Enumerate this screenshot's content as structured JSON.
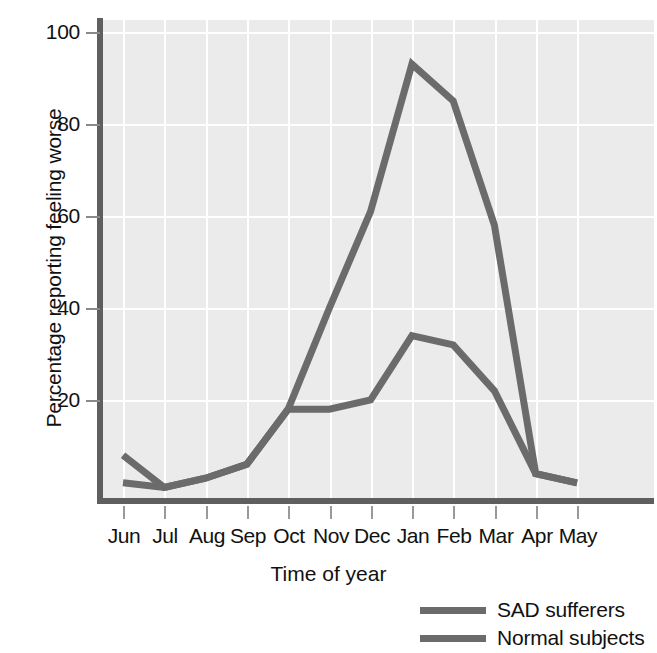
{
  "chart_data": {
    "type": "line",
    "title": "",
    "xlabel": "Time of year",
    "ylabel": "Percentage reporting feeling worse",
    "categories": [
      "Jun",
      "Jul",
      "Aug",
      "Sep",
      "Oct",
      "Nov",
      "Dec",
      "Jan",
      "Feb",
      "Mar",
      "Apr",
      "May"
    ],
    "xtick_labels": [
      "Jun",
      "Jul",
      "Aug",
      "Sep",
      "Oct",
      "Nov",
      "Dec",
      "Jan",
      "Feb",
      "Mar",
      "Apr",
      "May"
    ],
    "ytick_labels": [
      "100",
      "80",
      "60",
      "40",
      "20"
    ],
    "ytick_values": [
      100,
      80,
      60,
      40,
      20
    ],
    "ylim": [
      0,
      104
    ],
    "xlim": [
      0,
      11
    ],
    "grid": true,
    "legend_position": "below-right",
    "series": [
      {
        "name": "SAD sufferers",
        "color": "#6b6b6b",
        "values": [
          8,
          1,
          3,
          6,
          18,
          40,
          61,
          93,
          85,
          58,
          4,
          2
        ]
      },
      {
        "name": "Normal subjects",
        "color": "#6b6b6b",
        "values": [
          2,
          1,
          3,
          6,
          18,
          18,
          20,
          34,
          32,
          22,
          4,
          2
        ]
      }
    ],
    "legend": [
      {
        "label": "SAD sufferers",
        "color": "#6b6b6b",
        "swatch": "line-swatch"
      },
      {
        "label": "Normal subjects",
        "color": "#6b6b6b",
        "swatch": "line-swatch"
      }
    ],
    "colors": {
      "plot_background": "#ebebeb",
      "gridline": "#ffffff",
      "axis": "#5f5f5f",
      "series": "#6b6b6b",
      "text": "#111111",
      "page_background": "#ffffff"
    }
  }
}
